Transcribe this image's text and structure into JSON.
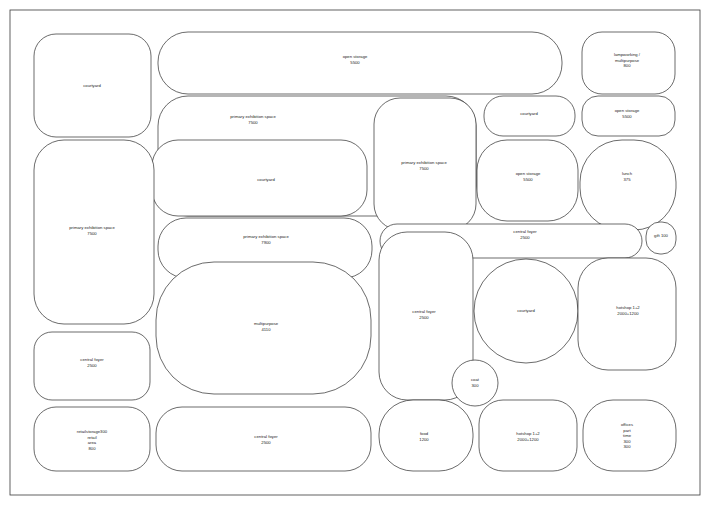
{
  "diagram": {
    "canvas": {
      "width": 710,
      "height": 505
    },
    "stroke_color": "#2b2b2b",
    "fill_color": "#ffffff",
    "text_color": "#1b1b1b"
  },
  "rooms": [
    {
      "id": "courtyard-tl",
      "name": "courtyard",
      "area": "",
      "extra": "",
      "label_x": 92,
      "label_y": 86,
      "x": 34,
      "y": 34,
      "w": 117,
      "h": 103,
      "r": 22
    },
    {
      "id": "open-storage-top",
      "name": "open storage",
      "area": "5500",
      "extra": "",
      "label_x": 355,
      "label_y": 60,
      "x": 158,
      "y": 32,
      "w": 404,
      "h": 62,
      "r": 30
    },
    {
      "id": "lampworking",
      "name": "lampworking /",
      "area": "800",
      "extra": "multipurpose",
      "label_x": 627,
      "label_y": 60,
      "x": 582,
      "y": 32,
      "w": 93,
      "h": 62,
      "r": 20
    },
    {
      "id": "primary-exh-top",
      "name": "primary exhibition space",
      "area": "7500",
      "extra": "",
      "label_x": 253,
      "label_y": 120,
      "x": 158,
      "y": 96,
      "w": 318,
      "h": 120,
      "r": 30
    },
    {
      "id": "courtyard-mid-top",
      "name": "courtyard",
      "area": "",
      "extra": "",
      "label_x": 529,
      "label_y": 114,
      "x": 484,
      "y": 96,
      "w": 91,
      "h": 40,
      "r": 19
    },
    {
      "id": "open-storage-r1",
      "name": "open storage",
      "area": "5500",
      "extra": "",
      "label_x": 627,
      "label_y": 114,
      "x": 582,
      "y": 96,
      "w": 93,
      "h": 40,
      "r": 16
    },
    {
      "id": "primary-exh-right",
      "name": "primary exhibition space",
      "area": "7500",
      "extra": "",
      "label_x": 424,
      "label_y": 166,
      "x": 374,
      "y": 98,
      "w": 102,
      "h": 132,
      "r": 26
    },
    {
      "id": "courtyard-big",
      "name": "courtyard",
      "area": "",
      "extra": "",
      "label_x": 266,
      "label_y": 180,
      "x": 152,
      "y": 140,
      "w": 215,
      "h": 76,
      "r": 26
    },
    {
      "id": "open-storage-r2",
      "name": "open storage",
      "area": "5500",
      "extra": "",
      "label_x": 528,
      "label_y": 177,
      "x": 477,
      "y": 140,
      "w": 101,
      "h": 81,
      "r": 30
    },
    {
      "id": "lunch",
      "name": "lunch",
      "area": "375",
      "extra": "",
      "label_x": 627,
      "label_y": 177,
      "x": 580,
      "y": 140,
      "w": 96,
      "h": 90,
      "r": 42
    },
    {
      "id": "primary-exh-left",
      "name": "primary exhibition space",
      "area": "7500",
      "extra": "",
      "label_x": 92,
      "label_y": 231,
      "x": 34,
      "y": 140,
      "w": 120,
      "h": 184,
      "r": 30
    },
    {
      "id": "primary-exh-center",
      "name": "primary exhibition space",
      "area": "7900",
      "extra": "",
      "label_x": 266,
      "label_y": 240,
      "x": 158,
      "y": 218,
      "w": 214,
      "h": 60,
      "r": 28
    },
    {
      "id": "central-foyer-top",
      "name": "central foyer",
      "area": "2500",
      "extra": "",
      "label_x": 525,
      "label_y": 235,
      "x": 380,
      "y": 224,
      "w": 262,
      "h": 34,
      "r": 17
    },
    {
      "id": "gift",
      "name": "gift 100",
      "area": "",
      "extra": "",
      "label_x": 661,
      "label_y": 236,
      "x": 646,
      "y": 222,
      "w": 30,
      "h": 32,
      "r": 14
    },
    {
      "id": "multipurpose",
      "name": "multipurpose",
      "area": "4110",
      "extra": "",
      "label_x": 266,
      "label_y": 327,
      "x": 156,
      "y": 262,
      "w": 215,
      "h": 132,
      "r": 58
    },
    {
      "id": "central-foyer-mid",
      "name": "central foyer",
      "area": "2500",
      "extra": "",
      "label_x": 424,
      "label_y": 315,
      "x": 379,
      "y": 232,
      "w": 94,
      "h": 168,
      "r": 28
    },
    {
      "id": "courtyard-circle",
      "name": "courtyard",
      "area": "",
      "extra": "",
      "label_x": 526,
      "label_y": 311,
      "x": 474,
      "y": 259,
      "w": 104,
      "h": 104,
      "r": 52
    },
    {
      "id": "hotshop-right",
      "name": "hotshop 1+2",
      "area": "2000+1200",
      "extra": "",
      "label_x": 628,
      "label_y": 311,
      "x": 578,
      "y": 258,
      "w": 98,
      "h": 112,
      "r": 30
    },
    {
      "id": "central-foyer-left",
      "name": "central foyer",
      "area": "2500",
      "extra": "",
      "label_x": 92,
      "label_y": 363,
      "x": 34,
      "y": 332,
      "w": 116,
      "h": 68,
      "r": 18
    },
    {
      "id": "coat",
      "name": "coat",
      "area": "300",
      "extra": "",
      "label_x": 475,
      "label_y": 383,
      "x": 452,
      "y": 360,
      "w": 46,
      "h": 46,
      "r": 23
    },
    {
      "id": "retail",
      "name": "retailstorage300",
      "area": "800",
      "extra": "retail\narea",
      "label_x": 92,
      "label_y": 440,
      "x": 34,
      "y": 407,
      "w": 116,
      "h": 64,
      "r": 22
    },
    {
      "id": "central-foyer-bot",
      "name": "central foyer",
      "area": "2500",
      "extra": "",
      "label_x": 266,
      "label_y": 440,
      "x": 156,
      "y": 407,
      "w": 215,
      "h": 64,
      "r": 26
    },
    {
      "id": "food",
      "name": "food",
      "area": "1200",
      "extra": "",
      "label_x": 424,
      "label_y": 437,
      "x": 379,
      "y": 400,
      "w": 94,
      "h": 71,
      "r": 34
    },
    {
      "id": "hotshop-bottom",
      "name": "hotshop 1+2",
      "area": "2000+1200",
      "extra": "",
      "label_x": 528,
      "label_y": 437,
      "x": 479,
      "y": 400,
      "w": 98,
      "h": 71,
      "r": 24
    },
    {
      "id": "offices",
      "name": "offices",
      "area": "300",
      "extra": "part\ntime\n300",
      "label_x": 627,
      "label_y": 436,
      "x": 583,
      "y": 400,
      "w": 93,
      "h": 71,
      "r": 30
    }
  ],
  "frames": [
    {
      "id": "outer-frame",
      "x": 10,
      "y": 10,
      "w": 690,
      "h": 485,
      "r": 0
    }
  ]
}
